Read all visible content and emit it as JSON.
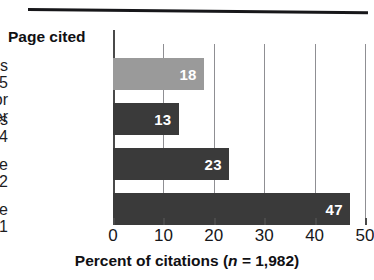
{
  "chart_data": {
    "type": "bar",
    "orientation": "horizontal",
    "title": "",
    "subtitle": "",
    "xlabel": "Percent of citations (n = 1,982)",
    "xlabel_parts": {
      "lead": "Percent of citations (",
      "italic": "n",
      "tail": " = 1,982)"
    },
    "ylabel": "Page cited",
    "categories": [
      "Pages 5\nor higher",
      "Pages 3-4",
      "Page 2",
      "Page 1"
    ],
    "values": [
      18,
      13,
      23,
      47
    ],
    "value_labels": [
      "18",
      "13",
      "23",
      "47"
    ],
    "bar_colors": [
      "#9a9a9a",
      "#3a3a3a",
      "#3a3a3a",
      "#3a3a3a"
    ],
    "xlim": [
      0,
      50
    ],
    "xticks": [
      0,
      10,
      20,
      30,
      40,
      50
    ],
    "xtick_labels": [
      "0",
      "10",
      "20",
      "30",
      "40",
      "50"
    ],
    "grid": true,
    "grid_axis": "x",
    "legend": false,
    "legend_position": "none",
    "sample_size": "1,982",
    "value_unit": "percent"
  },
  "style": {
    "accent_dark": "#3a3a3a",
    "accent_light": "#9a9a9a",
    "grid_color": "#8f8f93",
    "axis_color": "#4a4a4a",
    "text_color": "#17171a",
    "label_text_color": "#ffffff",
    "background": "#ffffff",
    "top_rule_color": "#17171a"
  }
}
